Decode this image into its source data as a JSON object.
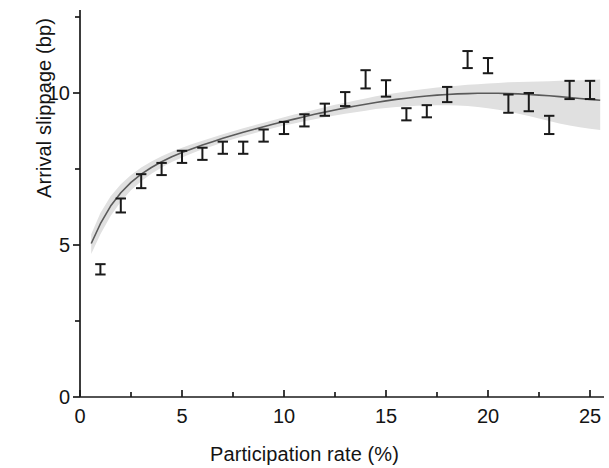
{
  "chart_data": {
    "type": "scatter",
    "title": "",
    "subtitle": "",
    "xlabel": "Participation rate (%)",
    "ylabel": "Arrival slippage (bp)",
    "xlim": [
      0,
      25.6
    ],
    "ylim": [
      0,
      12.5
    ],
    "xticks": [
      0,
      5,
      10,
      15,
      20,
      25
    ],
    "xticklabels": [
      "0",
      "5",
      "10",
      "15",
      "20",
      "25"
    ],
    "xminorticks": [
      2.5,
      7.5,
      12.5,
      17.5,
      22.5
    ],
    "yticks": [
      0,
      5,
      10
    ],
    "yticklabels": [
      "0",
      "5",
      "10"
    ],
    "yminorticks": [
      2.5,
      7.5,
      12.5
    ],
    "grid": false,
    "legend": null,
    "annotations": [],
    "series": [
      {
        "name": "Binned mean arrival slippage",
        "type": "scatter-errorbar",
        "marker": "errorbar-capped",
        "color": "#1a1a1a",
        "x": [
          1,
          2,
          3,
          4,
          5,
          6,
          7,
          8,
          9,
          10,
          11,
          12,
          13,
          14,
          15,
          16,
          17,
          18,
          19,
          20,
          21,
          22,
          23,
          24,
          25
        ],
        "values": [
          4.2,
          6.3,
          7.1,
          7.5,
          7.9,
          8.0,
          8.2,
          8.2,
          8.6,
          8.85,
          9.1,
          9.45,
          9.8,
          10.45,
          10.15,
          9.3,
          9.4,
          9.95,
          11.1,
          10.9,
          9.65,
          9.7,
          8.95,
          10.1,
          10.1
        ],
        "yerr": [
          0.17,
          0.23,
          0.23,
          0.2,
          0.2,
          0.2,
          0.2,
          0.2,
          0.2,
          0.2,
          0.2,
          0.2,
          0.23,
          0.3,
          0.27,
          0.2,
          0.2,
          0.25,
          0.28,
          0.25,
          0.3,
          0.3,
          0.3,
          0.3,
          0.3
        ]
      },
      {
        "name": "Fitted curve",
        "type": "line",
        "color": "#5a5a5a",
        "x": [
          0.55,
          1,
          1.5,
          2,
          2.5,
          3,
          3.5,
          4,
          4.5,
          5,
          5.5,
          6,
          6.5,
          7,
          7.5,
          8,
          8.5,
          9,
          9.5,
          10,
          10.5,
          11,
          11.5,
          12,
          12.5,
          13,
          13.5,
          14,
          14.5,
          15,
          15.5,
          16,
          16.5,
          17,
          17.5,
          18,
          18.5,
          19,
          19.5,
          20,
          20.5,
          21,
          21.5,
          22,
          22.5,
          23,
          23.5,
          24,
          24.5,
          25,
          25.5
        ],
        "values": [
          5.05,
          5.7,
          6.28,
          6.72,
          7.06,
          7.33,
          7.55,
          7.74,
          7.9,
          8.04,
          8.17,
          8.29,
          8.4,
          8.51,
          8.61,
          8.71,
          8.8,
          8.89,
          8.98,
          9.06,
          9.14,
          9.22,
          9.3,
          9.37,
          9.44,
          9.51,
          9.57,
          9.63,
          9.69,
          9.74,
          9.79,
          9.83,
          9.87,
          9.9,
          9.93,
          9.95,
          9.97,
          9.98,
          9.99,
          9.99,
          9.99,
          9.98,
          9.97,
          9.95,
          9.93,
          9.91,
          9.88,
          9.85,
          9.82,
          9.79,
          9.76
        ]
      },
      {
        "name": "Confidence band",
        "type": "band",
        "color": "#e0e0e0",
        "x": [
          0.55,
          1,
          1.5,
          2,
          2.5,
          3,
          3.5,
          4,
          4.5,
          5,
          5.5,
          6,
          6.5,
          7,
          7.5,
          8,
          8.5,
          9,
          9.5,
          10,
          10.5,
          11,
          11.5,
          12,
          12.5,
          13,
          13.5,
          14,
          14.5,
          15,
          15.5,
          16,
          16.5,
          17,
          17.5,
          18,
          18.5,
          19,
          19.5,
          20,
          20.5,
          21,
          21.5,
          22,
          22.5,
          23,
          23.5,
          24,
          24.5,
          25,
          25.5
        ],
        "upper": [
          5.35,
          6.05,
          6.6,
          7.0,
          7.3,
          7.55,
          7.75,
          7.92,
          8.07,
          8.2,
          8.32,
          8.43,
          8.54,
          8.64,
          8.74,
          8.84,
          8.93,
          9.02,
          9.11,
          9.2,
          9.29,
          9.37,
          9.45,
          9.53,
          9.61,
          9.68,
          9.75,
          9.82,
          9.89,
          9.95,
          10.0,
          10.05,
          10.1,
          10.14,
          10.18,
          10.21,
          10.24,
          10.27,
          10.29,
          10.31,
          10.33,
          10.35,
          10.36,
          10.37,
          10.38,
          10.39,
          10.4,
          10.41,
          10.42,
          10.43,
          10.44
        ],
        "lower": [
          4.7,
          5.35,
          5.95,
          6.42,
          6.8,
          7.1,
          7.34,
          7.55,
          7.73,
          7.88,
          8.02,
          8.15,
          8.26,
          8.37,
          8.48,
          8.58,
          8.67,
          8.76,
          8.85,
          8.93,
          9.0,
          9.07,
          9.14,
          9.2,
          9.26,
          9.32,
          9.37,
          9.42,
          9.47,
          9.51,
          9.54,
          9.56,
          9.58,
          9.59,
          9.6,
          9.6,
          9.59,
          9.57,
          9.54,
          9.5,
          9.45,
          9.39,
          9.32,
          9.24,
          9.16,
          9.08,
          9.0,
          8.93,
          8.87,
          8.82,
          8.78
        ]
      }
    ]
  },
  "figure": {
    "xaxis_title": "Participation rate (%)",
    "yaxis_title": "Arrival slippage (bp)"
  }
}
